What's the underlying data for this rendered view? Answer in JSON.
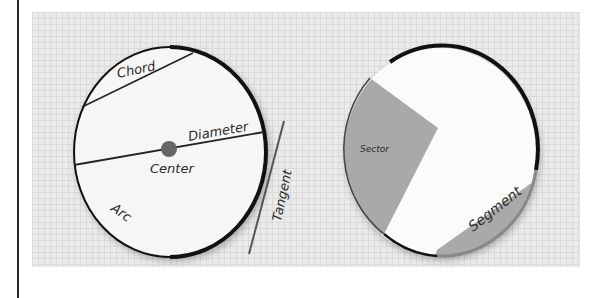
{
  "diagram": {
    "left_circle": {
      "labels": {
        "chord": "Chord",
        "diameter": "Diameter",
        "center": "Center",
        "arc": "Arc",
        "tangent": "Tangent"
      }
    },
    "right_circle": {
      "labels": {
        "sector": "Sector",
        "segment": "Segment"
      }
    },
    "colors": {
      "grid_background": "#ebebeb",
      "circle_fill": "#f7f7f7",
      "outline": "#111111",
      "shaded_region": "#a9a9a9",
      "center_dot": "#666666"
    }
  }
}
